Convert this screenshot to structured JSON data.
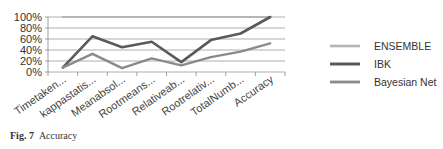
{
  "chart_data": {
    "type": "line",
    "title": "",
    "xlabel": "",
    "ylabel": "",
    "ylim": [
      0,
      100
    ],
    "y_ticks": [
      "0%",
      "20%",
      "40%",
      "60%",
      "80%",
      "100%"
    ],
    "grid": true,
    "legend_position": "right",
    "categories": [
      "Timetaken...",
      "kappastatis...",
      "Meanabsol...",
      "Rootmeans...",
      "Relativeab...",
      "Rootrelativ...",
      "TotalNumb...",
      "Accuracy"
    ],
    "series": [
      {
        "name": "ENSEMBLE",
        "color": "#b5b5b5",
        "width": 2.2,
        "values": [
          100,
          100,
          100,
          100,
          100,
          100,
          100,
          100
        ]
      },
      {
        "name": "IBK",
        "color": "#5a5a5a",
        "width": 2.6,
        "values": [
          8,
          65,
          45,
          55,
          18,
          58,
          70,
          100
        ]
      },
      {
        "name": "Bayesian Net",
        "color": "#8a8a8a",
        "width": 2.4,
        "values": [
          8,
          33,
          7,
          25,
          12,
          27,
          37,
          52
        ]
      }
    ]
  },
  "caption": {
    "label": "Fig. 7",
    "text": "Accuracy"
  }
}
